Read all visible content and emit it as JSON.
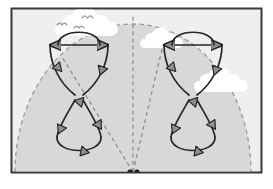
{
  "figure": {
    "title": "Kite figure-eight flight paths in the wind window",
    "frame": {
      "border_color": "#3a3a3a",
      "background_color": "#ffffff",
      "sky_color": "#dcdcdc",
      "width": 273,
      "height": 189
    },
    "wind_window": {
      "name": "wind-window-dome",
      "fill_color": "#d8d8d8",
      "edge_color": "#9a9a9a",
      "edge_style": "dashed",
      "center_x": 133,
      "ground_y": 172,
      "radius_x": 118,
      "radius_y": 148
    },
    "anchor": {
      "label": "ground anchor",
      "color": "#101010",
      "dots": [
        {
          "cx": 130,
          "cy": 172,
          "r": 2.6
        },
        {
          "cx": 137,
          "cy": 172,
          "r": 2.6
        }
      ]
    },
    "tether_lines": {
      "color": "#8c8c8c",
      "style": "dashed",
      "lines": [
        {
          "name": "tether-left",
          "x1": 133,
          "y1": 172,
          "x2": 62,
          "y2": 57
        },
        {
          "name": "tether-center",
          "x1": 133,
          "y1": 172,
          "x2": 133,
          "y2": 14
        },
        {
          "name": "tether-right",
          "x1": 133,
          "y1": 172,
          "x2": 163,
          "y2": 45
        }
      ]
    },
    "paths": {
      "stroke_color": "#262626",
      "arrow_fill": "#8e8e8e",
      "arrow_stroke": "#1e1e1e",
      "figures": [
        {
          "name": "figure-eight-left",
          "side": "left",
          "crossing_point": {
            "x": 78,
            "y": 98
          },
          "top_bar": {
            "y": 45,
            "x_left": 45,
            "x_right": 112
          },
          "upper_lobe_width": 40,
          "lower_lobe_bottom_y": 160,
          "arrow_count": 8
        },
        {
          "name": "figure-eight-right",
          "side": "right",
          "crossing_point": {
            "x": 192,
            "y": 98
          },
          "top_bar": {
            "y": 45,
            "x_left": 159,
            "x_right": 226
          },
          "upper_lobe_width": 40,
          "lower_lobe_bottom_y": 160,
          "arrow_count": 8
        }
      ]
    },
    "clouds": {
      "fill_color": "#ffffff",
      "items": [
        {
          "name": "cloud-top-left",
          "cx": 90,
          "cy": 28,
          "scale": 1.15
        },
        {
          "name": "cloud-top-center",
          "cx": 158,
          "cy": 40,
          "scale": 0.72
        },
        {
          "name": "cloud-mid-right",
          "cx": 223,
          "cy": 82,
          "scale": 1.0
        }
      ]
    },
    "birds": {
      "stroke_color": "#9a9a9a",
      "items": [
        {
          "name": "bird-1",
          "cx": 62,
          "cy": 24,
          "scale": 1.0
        },
        {
          "name": "bird-2",
          "cx": 88,
          "cy": 17,
          "scale": 1.1
        },
        {
          "name": "bird-3",
          "cx": 79,
          "cy": 27,
          "scale": 1.0
        }
      ]
    }
  }
}
